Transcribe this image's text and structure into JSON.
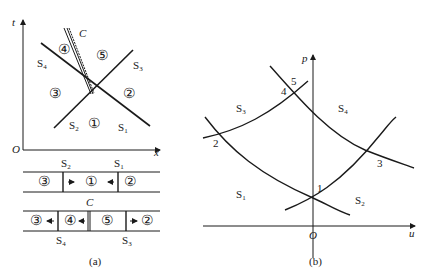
{
  "panel_a": {
    "caption": "(a)",
    "axes": {
      "x_label": "x",
      "y_label": "t",
      "origin": "O"
    },
    "xt_diagram": {
      "curve_labels": {
        "S4": "S",
        "S4_sub": "4",
        "S3": "S",
        "S3_sub": "3",
        "S2": "S",
        "S2_sub": "2",
        "S1": "S",
        "S1_sub": "1"
      },
      "contact_label": "C",
      "regions": [
        "①",
        "②",
        "③",
        "④",
        "⑤"
      ]
    },
    "tube_before": {
      "top_labels": [
        {
          "t": "S",
          "s": "2"
        },
        {
          "t": "S",
          "s": "1"
        }
      ],
      "regions": [
        "③",
        "①",
        "②"
      ]
    },
    "tube_after": {
      "contact_label": "C",
      "bottom_labels": [
        {
          "t": "S",
          "s": "4"
        },
        {
          "t": "S",
          "s": "3"
        }
      ],
      "regions": [
        "③",
        "④",
        "⑤",
        "②"
      ]
    }
  },
  "panel_b": {
    "caption": "(b)",
    "axes": {
      "x_label": "u",
      "y_label": "p",
      "origin": "O"
    },
    "region_labels": {
      "S3": "S",
      "S3_sub": "3",
      "S4": "S",
      "S4_sub": "4",
      "S1": "S",
      "S1_sub": "1",
      "S2": "S",
      "S2_sub": "2"
    },
    "points": [
      "1",
      "2",
      "3",
      "4",
      "5"
    ]
  }
}
